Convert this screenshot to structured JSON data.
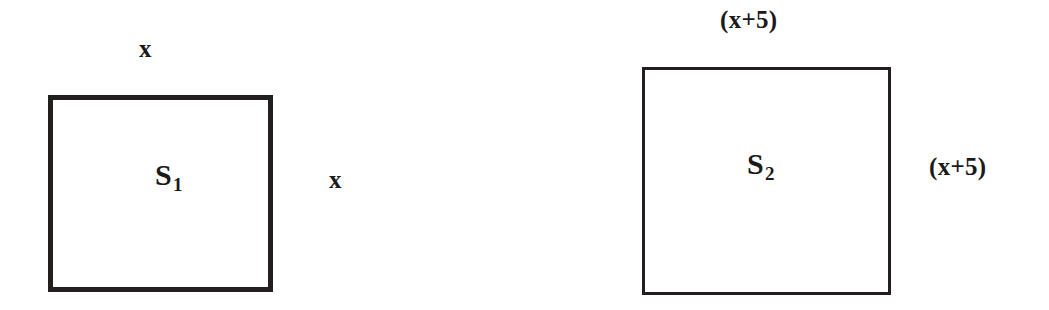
{
  "figure": {
    "background_color": "#ffffff",
    "stroke_color": "#231f1f",
    "text_color": "#1a1a1a"
  },
  "shapes": [
    {
      "id": "square-1",
      "name_letter": "S",
      "name_subscript": "1",
      "top_label": "x",
      "right_label": "x",
      "side_expression": "x",
      "border_width_px": 5
    },
    {
      "id": "square-2",
      "name_letter": "S",
      "name_subscript": "2",
      "top_label": "(x+5)",
      "right_label": "(x+5)",
      "side_expression": "(x+5)",
      "border_width_px": 3
    }
  ]
}
